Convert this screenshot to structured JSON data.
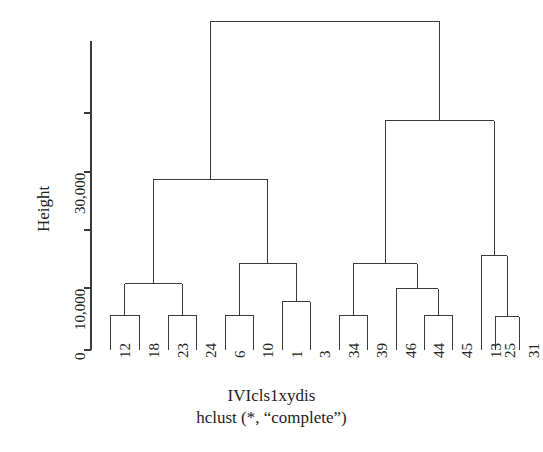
{
  "figure": {
    "main_title": "IVIcls1xydis",
    "sub_title": "hclust (*, “complete”)",
    "y_axis_label": "Height",
    "line_color": "#3a3a3a",
    "text_color": "#232323",
    "background": "#ffffff"
  },
  "chart_data": {
    "type": "line",
    "plot_kind": "dendrogram",
    "title": "IVIcls1xydis",
    "subtitle": "hclust (*, “complete”)",
    "xlabel": "",
    "ylabel": "Height",
    "ylim": [
      0,
      56000
    ],
    "grid": false,
    "legend": null,
    "y_ticks": [
      0,
      10000,
      20000,
      30000,
      40000
    ],
    "y_ticklabels": [
      "0",
      "10,000",
      "",
      "30,000",
      ""
    ],
    "y_ticklabels_shown": [
      "0",
      "10,000",
      "30,000"
    ],
    "leaf_labels": [
      "12",
      "18",
      "23",
      "24",
      "6",
      "10",
      "1",
      "3",
      "34",
      "39",
      "46",
      "44",
      "45",
      "13",
      "25",
      "31"
    ],
    "leaf_order": [
      12,
      18,
      23,
      24,
      6,
      10,
      1,
      3,
      34,
      39,
      46,
      44,
      45,
      13,
      25,
      31
    ],
    "n_leaves": 16,
    "linkage_method": "complete",
    "merges": [
      {
        "id": "m1",
        "left": "12",
        "right": "18",
        "height": 5600
      },
      {
        "id": "m2",
        "left": "23",
        "right": "24",
        "height": 5600
      },
      {
        "id": "m3",
        "left": "m1",
        "right": "m2",
        "height": 10700
      },
      {
        "id": "m4",
        "left": "6",
        "right": "10",
        "height": 5600
      },
      {
        "id": "m5",
        "left": "1",
        "right": "3",
        "height": 7800
      },
      {
        "id": "m6",
        "left": "m4",
        "right": "m5",
        "height": 14000
      },
      {
        "id": "m7",
        "left": "m3",
        "right": "m6",
        "height": 27500
      },
      {
        "id": "m8",
        "left": "34",
        "right": "39",
        "height": 5600
      },
      {
        "id": "m9",
        "left": "44",
        "right": "45",
        "height": 5600
      },
      {
        "id": "m10",
        "left": "46",
        "right": "m9",
        "height": 9900
      },
      {
        "id": "m11",
        "left": "m8",
        "right": "m10",
        "height": 13900
      },
      {
        "id": "m12",
        "left": "25",
        "right": "31",
        "height": 5400
      },
      {
        "id": "m13",
        "left": "13",
        "right": "m12",
        "height": 15200
      },
      {
        "id": "m14",
        "left": "m11",
        "right": "m13",
        "height": 37000
      },
      {
        "id": "m15",
        "left": "m7",
        "right": "m14",
        "height": 53000
      }
    ]
  },
  "geometry": {
    "axis_x": 91,
    "axis_top_y": 41,
    "baseline_y": 350,
    "tick_y_0": 350,
    "tick_y_10000": 288,
    "tick_y_20000": 230,
    "tick_y_30000": 172,
    "tick_y_40000": 113,
    "leaf_x": [
      110,
      139,
      168,
      196,
      225,
      253,
      282,
      310,
      339,
      367,
      396,
      424,
      452,
      481,
      495,
      519
    ],
    "px_per_unit": 0.00582
  },
  "tick_label_text": {
    "t0": "0",
    "t10000": "10,000",
    "t30000": "30,000"
  }
}
